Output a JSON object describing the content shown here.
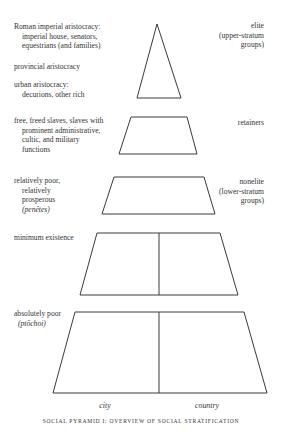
{
  "figure": {
    "caption": "SOCIAL PYRAMID I: OVERVIEW OF SOCIAL STRATIFICATION",
    "line_color": "#3a3a3a",
    "left_labels": [
      {
        "id": "roman-imperial-aristocracy",
        "lines": [
          "Roman imperial aristocracy:",
          "imperial house, senators,",
          "equestrians (and families)"
        ]
      },
      {
        "id": "provincial-aristocracy",
        "lines": [
          "provincial aristocracy"
        ]
      },
      {
        "id": "urban-aristocracy",
        "lines": [
          "urban aristocracy:",
          "decurions, other rich"
        ]
      },
      {
        "id": "retainer-groups",
        "lines": [
          "free, freed slaves, slaves with",
          "prominent administrative,",
          "cultic, and military",
          "functions"
        ]
      },
      {
        "id": "relatively-poor",
        "lines": [
          "relatively poor,",
          "relatively",
          "prosperous",
          "(penētes)"
        ]
      },
      {
        "id": "minimum-existence",
        "lines": [
          "minimum existence"
        ]
      },
      {
        "id": "absolutely-poor",
        "lines": [
          "absolutely poor",
          "(ptōchoi)"
        ]
      }
    ],
    "right_labels": [
      {
        "id": "elite",
        "lines": [
          "elite",
          "(upper-stratum",
          "groups)"
        ]
      },
      {
        "id": "retainers",
        "lines": [
          "retainers"
        ]
      },
      {
        "id": "nonelite",
        "lines": [
          "nonelite",
          "(lower-stratum",
          "groups)"
        ]
      }
    ],
    "axis_labels": {
      "city": "city",
      "country": "country"
    }
  }
}
